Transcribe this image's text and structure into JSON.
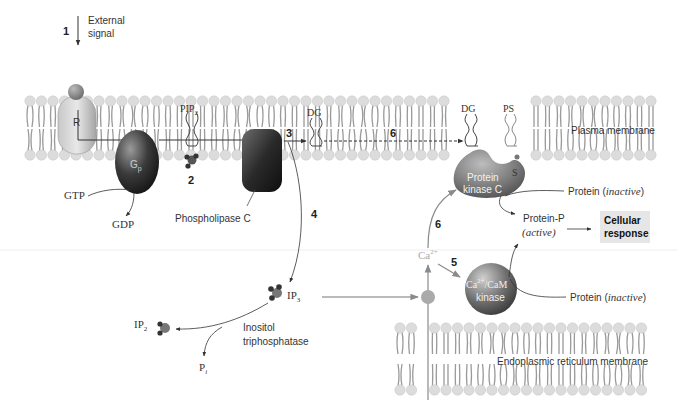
{
  "steps": {
    "s1": "1",
    "s2": "2",
    "s3": "3",
    "s4": "4",
    "s5": "5",
    "s6a": "6",
    "s6b": "6"
  },
  "labels": {
    "external_signal_line1": "External",
    "external_signal_line2": "signal",
    "receptor": "R",
    "gprotein": "G",
    "gprotein_sub": "p",
    "pip2": "PIP",
    "pip2_sub": "2",
    "dg_left": "DG",
    "dg_right": "DG",
    "ps": "PS",
    "s": "S",
    "plasma_membrane": "Plasma membrane",
    "gtp": "GTP",
    "gdp": "GDP",
    "phospholipase_c": "Phospholipase C",
    "pkc_line1": "Protein",
    "pkc_line2": "kinase C",
    "protein_inactive_1": "Protein (",
    "inactive_1": "inactive",
    "close_1": ")",
    "protein_p": "Protein-P",
    "active": "(active)",
    "cellular_response_line1": "Cellular",
    "cellular_response_line2": "response",
    "ca": "Ca",
    "ca_sup": "2+",
    "camk_line1": "Ca",
    "camk_sup": "2+",
    "camk_line1b": "/CaM",
    "camk_line2": "kinase",
    "protein_inactive_2": "Protein (",
    "inactive_2": "inactive",
    "close_2": ")",
    "ip3": "IP",
    "ip3_sub": "3",
    "ip2": "IP",
    "ip2_sub": "2",
    "pi": "P",
    "pi_sub": "i",
    "inositol_line1": "Inositol",
    "inositol_line2": "triphosphatase",
    "er_membrane": "Endoplasmic reticulum membrane"
  },
  "colors": {
    "membrane_head": "#dcdcdc",
    "membrane_tail": "#9a9a9a",
    "arrow": "#333333",
    "ca_arrow": "#8a8a8a",
    "response_box": "#e6e6e6"
  }
}
